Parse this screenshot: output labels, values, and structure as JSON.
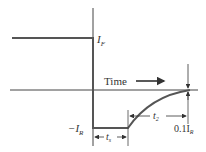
{
  "diagram": {
    "type": "diode reverse recovery current waveform",
    "labels": {
      "forward_current": "I",
      "forward_current_sub": "F",
      "reverse_current": "−I",
      "reverse_current_sub": "R",
      "time": "Time",
      "storage_time": "t",
      "storage_time_sub": "s",
      "transition_time": "t",
      "transition_time_sub": "2",
      "threshold": "0.1I",
      "threshold_sub": "R"
    },
    "colors": {
      "waveform": "#555555",
      "axes": "#444444",
      "text": "#333333"
    }
  }
}
